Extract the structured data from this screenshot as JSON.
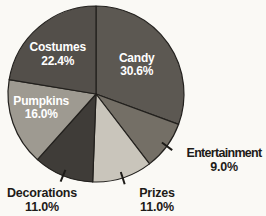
{
  "chart_data": {
    "type": "pie",
    "title": "",
    "start_angle_deg": 0,
    "direction": "clockwise",
    "categories": [
      "Candy",
      "Entertainment",
      "Prizes",
      "Decorations",
      "Pumpkins",
      "Costumes"
    ],
    "values": [
      30.6,
      9.0,
      11.0,
      11.0,
      16.0,
      22.4
    ],
    "slices": [
      {
        "label": "Candy",
        "value": 30.6,
        "pct_label": "30.6%",
        "color": "#5c5852",
        "label_placement": "inside"
      },
      {
        "label": "Entertainment",
        "value": 9.0,
        "pct_label": "9.0%",
        "color": "#746f66",
        "label_placement": "outside"
      },
      {
        "label": "Prizes",
        "value": 11.0,
        "pct_label": "11.0%",
        "color": "#c9c5bb",
        "label_placement": "outside"
      },
      {
        "label": "Decorations",
        "value": 11.0,
        "pct_label": "11.0%",
        "color": "#3f3c38",
        "label_placement": "outside"
      },
      {
        "label": "Pumpkins",
        "value": 16.0,
        "pct_label": "16.0%",
        "color": "#9e9a91",
        "label_placement": "inside"
      },
      {
        "label": "Costumes",
        "value": 22.4,
        "pct_label": "22.4%",
        "color": "#534f4a",
        "label_placement": "inside"
      }
    ],
    "legend": "none",
    "inside_label_color": "#ffffff",
    "outside_label_color": "#1d1b18",
    "outline_color": "#22201d",
    "background": "#faf9f5"
  }
}
